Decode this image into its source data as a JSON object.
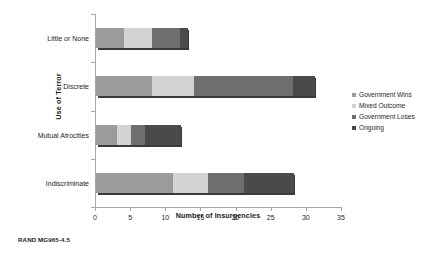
{
  "caption": "RAND MG965-4.5",
  "chart_data": {
    "type": "bar",
    "orientation": "horizontal",
    "stacked": true,
    "title": "",
    "xlabel": "Number of Insurgencies",
    "ylabel": "Use of Terror",
    "categories": [
      "Little or None",
      "Discrete",
      "Mutual Atrocities",
      "Indiscriminate"
    ],
    "xlim": [
      0,
      35
    ],
    "xticks": [
      "0",
      "5",
      "10",
      "15",
      "20",
      "25",
      "30",
      "35"
    ],
    "grid": false,
    "legend_position": "right",
    "series": [
      {
        "name": "Government Wins",
        "color": "#9b9b9b",
        "values": [
          4,
          8,
          3,
          11
        ]
      },
      {
        "name": "Mixed Outcome",
        "color": "#d3d3d3",
        "values": [
          4,
          6,
          2,
          5
        ]
      },
      {
        "name": "Government Loses",
        "color": "#6e6e6e",
        "values": [
          4,
          14,
          2,
          5
        ]
      },
      {
        "name": "Ongoing",
        "color": "#4a4a4a",
        "values": [
          1,
          3,
          5,
          7
        ]
      }
    ],
    "totals": [
      13,
      31,
      12,
      28
    ]
  }
}
